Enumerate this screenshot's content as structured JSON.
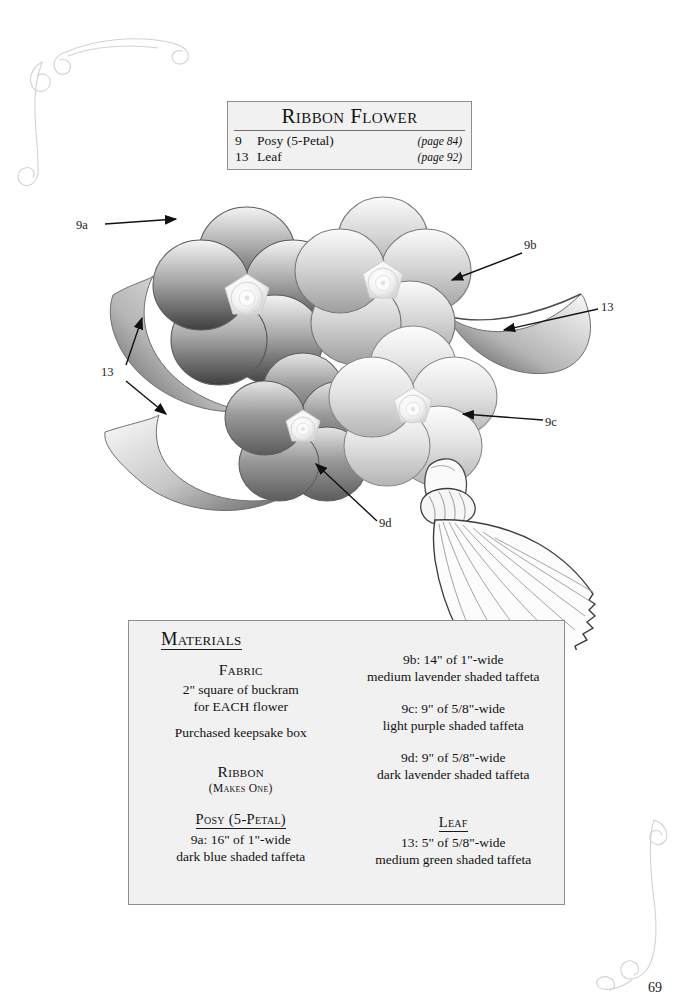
{
  "page": {
    "number": "69",
    "background_color": "#ffffff",
    "box_fill": "#f1f1f1",
    "box_border": "#8e8e8e",
    "ink": "#1a1a1a"
  },
  "title_box": {
    "heading": "Ribbon Flower",
    "rows": [
      {
        "number": "9",
        "name": "Posy (5-Petal)",
        "page_ref": "(page 84)"
      },
      {
        "number": "13",
        "name": "Leaf",
        "page_ref": "(page 92)"
      }
    ]
  },
  "callouts": [
    {
      "id": "9a",
      "label": "9a"
    },
    {
      "id": "13a",
      "label": "13"
    },
    {
      "id": "9b",
      "label": "9b"
    },
    {
      "id": "13b",
      "label": "13"
    },
    {
      "id": "9c",
      "label": "9c"
    },
    {
      "id": "9d",
      "label": "9d"
    }
  ],
  "materials": {
    "heading": "Materials",
    "left": {
      "fabric_heading": "Fabric",
      "fabric_lines": [
        "2\" square of buckram",
        "for EACH flower",
        "Purchased keepsake box"
      ],
      "ribbon_heading": "Ribbon",
      "ribbon_note": "(Makes One)",
      "posy_heading": "Posy (5-Petal)",
      "posy_lines": [
        "9a: 16\" of 1\"-wide",
        "dark blue shaded taffeta"
      ]
    },
    "right": {
      "items": [
        {
          "size": "9b: 14\" of 1\"-wide",
          "desc": "medium lavender shaded taffeta"
        },
        {
          "size": "9c: 9\" of 5/8\"-wide",
          "desc": "light purple shaded taffeta"
        },
        {
          "size": "9d: 9\" of 5/8\"-wide",
          "desc": "dark lavender shaded taffeta"
        }
      ],
      "leaf_heading": "Leaf",
      "leaf_lines": [
        "13: 5\" of 5/8\"-wide",
        "medium green shaded taffeta"
      ]
    }
  },
  "illustration": {
    "description": "grayscale-shaded ribbon posy flowers with leaves and a hanging tassel",
    "flowers": [
      {
        "id": "9a",
        "tone": "dark-blue"
      },
      {
        "id": "9b",
        "tone": "medium-lavender"
      },
      {
        "id": "9c",
        "tone": "light-purple"
      },
      {
        "id": "9d",
        "tone": "dark-lavender"
      }
    ],
    "leaves": 3,
    "tassel": 1
  }
}
